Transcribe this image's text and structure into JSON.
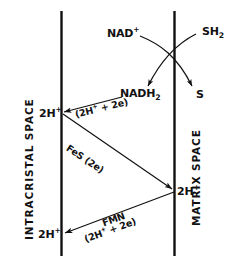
{
  "diagram": {
    "membranes": {
      "left_label": "INTRACRISTAL SPACE",
      "right_label": "MATRIX SPACE",
      "line_color": "#111111"
    },
    "species": {
      "nad_plus": "NAD",
      "nad_plus_charge": "+",
      "sh2": "SH",
      "sh2_sub": "2",
      "nadh2": "NADH",
      "nadh2_sub": "2",
      "s": "S",
      "proton_label": "2H",
      "proton_charge": "+"
    },
    "carriers": {
      "nadh_transfer": "(2H",
      "nadh_transfer_charge": "+",
      "nadh_transfer_tail": " + 2e)",
      "fes": "FeS (2e)",
      "fmn": "FMN",
      "fmn_transfer": "(2H",
      "fmn_transfer_charge": "+",
      "fmn_transfer_tail": " + 2e)"
    },
    "protons": {
      "upper_left": "2H",
      "upper_left_charge": "+",
      "mid_right": "2H",
      "mid_right_charge": "+",
      "lower_left": "2H",
      "lower_left_charge": "+"
    }
  }
}
